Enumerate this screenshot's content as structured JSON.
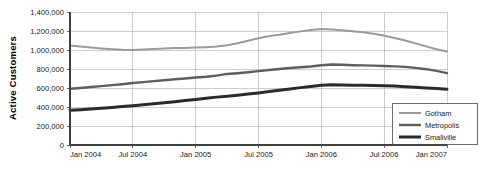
{
  "chart_data": {
    "type": "line",
    "title": "",
    "xlabel": "",
    "ylabel": "Active Customers",
    "ylim": [
      0,
      1400000
    ],
    "ytick_labels": [
      "0",
      "200,000",
      "400,000",
      "600,000",
      "800,000",
      "1,000,000",
      "1,200,000",
      "1,400,000"
    ],
    "ytick_values": [
      0,
      200000,
      400000,
      600000,
      800000,
      1000000,
      1200000,
      1400000
    ],
    "xtick_labels": [
      "Jan 2004",
      "Jul 2004",
      "Jan 2005",
      "Jul 2005",
      "Jan 2006",
      "Jul 2006",
      "Jan 2007"
    ],
    "grid": true,
    "legend_position": "bottom-right",
    "x": [
      "Jan 2004",
      "Feb 2004",
      "Mar 2004",
      "Apr 2004",
      "May 2004",
      "Jun 2004",
      "Jul 2004",
      "Aug 2004",
      "Sep 2004",
      "Oct 2004",
      "Nov 2004",
      "Dec 2004",
      "Jan 2005",
      "Feb 2005",
      "Mar 2005",
      "Apr 2005",
      "May 2005",
      "Jun 2005",
      "Jul 2005",
      "Aug 2005",
      "Sep 2005",
      "Oct 2005",
      "Nov 2005",
      "Dec 2005",
      "Jan 2006",
      "Feb 2006",
      "Mar 2006",
      "Apr 2006",
      "May 2006",
      "Jun 2006",
      "Jul 2006",
      "Aug 2006",
      "Sep 2006",
      "Oct 2006",
      "Nov 2006",
      "Dec 2006",
      "Jan 2007"
    ],
    "series": [
      {
        "name": "Gotham",
        "color": "#9a9a9a",
        "width": 2.0,
        "values": [
          1048000,
          1038000,
          1026000,
          1016000,
          1008000,
          1002000,
          1000000,
          1004000,
          1010000,
          1016000,
          1020000,
          1022000,
          1026000,
          1030000,
          1036000,
          1050000,
          1072000,
          1098000,
          1124000,
          1146000,
          1160000,
          1178000,
          1196000,
          1210000,
          1220000,
          1216000,
          1208000,
          1198000,
          1186000,
          1170000,
          1150000,
          1126000,
          1100000,
          1070000,
          1038000,
          1008000,
          984000
        ]
      },
      {
        "name": "Metropolis",
        "color": "#5e5e5e",
        "width": 2.4,
        "values": [
          592000,
          600000,
          610000,
          620000,
          630000,
          640000,
          652000,
          662000,
          672000,
          682000,
          692000,
          700000,
          710000,
          718000,
          730000,
          748000,
          756000,
          766000,
          778000,
          790000,
          800000,
          810000,
          818000,
          826000,
          840000,
          848000,
          844000,
          840000,
          838000,
          836000,
          832000,
          828000,
          822000,
          812000,
          798000,
          780000,
          756000
        ]
      },
      {
        "name": "Smallville",
        "color": "#2b2b2b",
        "width": 3.0,
        "values": [
          366000,
          372000,
          380000,
          388000,
          396000,
          404000,
          414000,
          424000,
          434000,
          444000,
          456000,
          468000,
          480000,
          492000,
          504000,
          514000,
          524000,
          536000,
          548000,
          562000,
          576000,
          590000,
          604000,
          616000,
          628000,
          634000,
          632000,
          630000,
          628000,
          626000,
          624000,
          620000,
          614000,
          608000,
          600000,
          594000,
          588000
        ]
      }
    ]
  },
  "legend": {
    "items": [
      {
        "label": "Gotham"
      },
      {
        "label": "Metropolis"
      },
      {
        "label": "Smallville"
      }
    ]
  }
}
